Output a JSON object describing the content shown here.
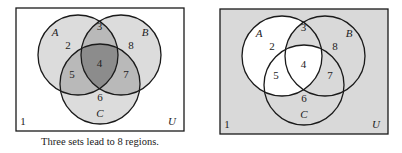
{
  "caption": "Three sets lead to 8 regions.",
  "colors": {
    "stroke": "#1a1a1a",
    "white": "#ffffff",
    "single": "#dcdcdc",
    "double": "#b9b9b9",
    "triple": "#8c8c8c",
    "shaded": "#d9d9d9"
  },
  "diagrams": [
    {
      "id": "left",
      "box": {
        "x": 16,
        "y": 8,
        "w": 168,
        "h": 123
      },
      "circles": {
        "A": {
          "cx": 78,
          "cy": 55,
          "r": 40
        },
        "B": {
          "cx": 121,
          "cy": 55,
          "r": 40
        },
        "C": {
          "cx": 100,
          "cy": 84,
          "r": 40
        }
      },
      "region_fill": {
        "1": "white",
        "2": "single",
        "3": "double",
        "4": "triple",
        "5": "double",
        "6": "single",
        "7": "double",
        "8": "single"
      }
    },
    {
      "id": "right",
      "box": {
        "x": 220,
        "y": 9,
        "w": 168,
        "h": 125
      },
      "circles": {
        "A": {
          "cx": 282,
          "cy": 56,
          "r": 40
        },
        "B": {
          "cx": 325,
          "cy": 56,
          "r": 40
        },
        "C": {
          "cx": 304,
          "cy": 85,
          "r": 40
        }
      },
      "region_fill": {
        "1": "shaded",
        "2": "white",
        "3": "shaded",
        "4": "white",
        "5": "white",
        "6": "shaded",
        "7": "shaded",
        "8": "shaded"
      }
    }
  ],
  "labels": {
    "set_A": "A",
    "set_B": "B",
    "set_C": "C",
    "universe": "U",
    "regions": [
      "1",
      "2",
      "3",
      "4",
      "5",
      "6",
      "7",
      "8"
    ]
  }
}
